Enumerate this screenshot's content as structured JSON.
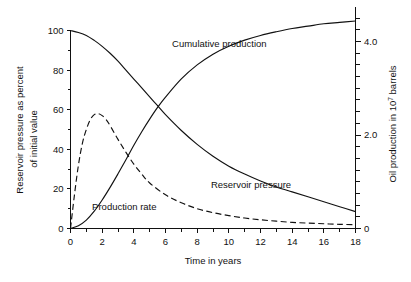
{
  "chart_data": {
    "type": "line",
    "title": "",
    "xlabel": "Time in years",
    "ylabel": "Reservoir pressure as percent of initial value",
    "ylabel_line1": "Reservoir pressure as percent",
    "ylabel_line2": "of initial value",
    "y2label": "Oil production in 10",
    "y2label_exponent": "7",
    "y2label_tail": " barrels",
    "xlim": [
      0,
      18
    ],
    "ylim": [
      0,
      100
    ],
    "y2lim": [
      0,
      4.75
    ],
    "grid": false,
    "legend_position": "inline-labels",
    "x_ticks": [
      0,
      2,
      4,
      6,
      8,
      10,
      12,
      14,
      16,
      18
    ],
    "x_tick_labels": [
      "0",
      "2",
      "4",
      "6",
      "8",
      "10",
      "12",
      "14",
      "16",
      "18"
    ],
    "x_minor_ticks": [
      1,
      3,
      5,
      7,
      9,
      11,
      13,
      15,
      17
    ],
    "y_ticks": [
      0,
      20,
      40,
      60,
      80,
      100
    ],
    "y_tick_labels": [
      "0",
      "20",
      "40",
      "60",
      "80",
      "100"
    ],
    "y2_ticks": [
      0,
      2.0,
      4.0
    ],
    "y2_tick_labels": [
      "0",
      "2.0",
      "4.0"
    ],
    "y2_minor_ticks": [
      0.25,
      0.5,
      0.75,
      1.0,
      1.25,
      1.5,
      1.75,
      2.25,
      2.5,
      2.75,
      3.0,
      3.25,
      3.5,
      3.75,
      4.25,
      4.5
    ],
    "series": [
      {
        "name": "Reservoir pressure",
        "label": "Reservoir pressure",
        "style": "solid",
        "axis": "left",
        "units": "percent of initial value",
        "x": [
          0,
          0.5,
          1,
          1.5,
          2,
          2.5,
          3,
          3.5,
          4,
          4.5,
          5,
          5.5,
          6,
          7,
          8,
          9,
          10,
          11,
          12,
          13,
          14,
          15,
          16,
          17,
          18
        ],
        "values": [
          100,
          99,
          97.5,
          95,
          92,
          88.5,
          84.5,
          80,
          75.5,
          71,
          66.5,
          62,
          57.5,
          49.5,
          42.5,
          36.5,
          31.5,
          27.5,
          24,
          21,
          18.5,
          16,
          13.5,
          11,
          8.5
        ]
      },
      {
        "name": "Production rate",
        "label": "Production rate",
        "style": "dashed",
        "axis": "left",
        "units": "percent of initial value",
        "x": [
          0,
          0.25,
          0.5,
          0.75,
          1,
          1.25,
          1.5,
          1.75,
          2,
          2.25,
          2.5,
          3,
          3.5,
          4,
          4.5,
          5,
          6,
          7,
          8,
          9,
          10,
          11,
          12,
          13,
          14,
          15,
          16,
          17,
          18
        ],
        "values": [
          0,
          17,
          32,
          43,
          50,
          55,
          57.5,
          58,
          57,
          55,
          52,
          45,
          38.5,
          32.5,
          27.5,
          23,
          17,
          13,
          10,
          8,
          6.5,
          5.3,
          4.4,
          3.7,
          3.1,
          2.7,
          2.4,
          2.1,
          1.9
        ]
      },
      {
        "name": "Cumulative production",
        "label": "Cumulative production",
        "style": "solid",
        "axis": "right",
        "units": "10^7 barrels",
        "x": [
          0,
          0.5,
          1,
          1.5,
          2,
          2.5,
          3,
          3.5,
          4,
          4.5,
          5,
          5.5,
          6,
          7,
          8,
          9,
          10,
          11,
          12,
          13,
          14,
          15,
          16,
          17,
          18
        ],
        "values": [
          0,
          0.06,
          0.18,
          0.37,
          0.61,
          0.88,
          1.17,
          1.47,
          1.78,
          2.07,
          2.34,
          2.59,
          2.81,
          3.2,
          3.5,
          3.73,
          3.9,
          4.03,
          4.13,
          4.21,
          4.28,
          4.33,
          4.38,
          4.41,
          4.44
        ]
      }
    ],
    "annotations": [
      {
        "text": "Cumulative production",
        "x": 9.4,
        "y_axis": "right",
        "y": 3.95
      },
      {
        "text": "Reservoir pressure",
        "x": 11.4,
        "y_axis": "left",
        "y": 22.0
      },
      {
        "text": "Production rate",
        "x": 3.4,
        "y_axis": "left",
        "y": 11.0
      }
    ]
  }
}
